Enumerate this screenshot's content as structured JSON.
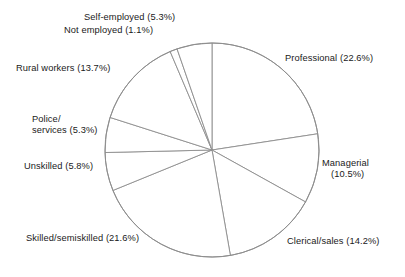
{
  "chart_data": {
    "type": "pie",
    "title": "",
    "subtitle": "",
    "xlabel": "",
    "ylabel": "",
    "legend_position": "none",
    "grid": false,
    "start_angle_deg": 0,
    "direction": "clockwise",
    "units": "percent",
    "total": 100.1,
    "categories": [
      "Professional",
      "Managerial",
      "Clerical/sales",
      "Skilled/semiskilled",
      "Unskilled",
      "Police/services",
      "Rural workers",
      "Not employed",
      "Self-employed"
    ],
    "values": [
      22.6,
      10.5,
      14.2,
      21.6,
      5.8,
      5.3,
      13.7,
      1.1,
      5.3
    ],
    "slices": [
      {
        "name": "Professional",
        "value": 22.6,
        "label": "Professional (22.6%)"
      },
      {
        "name": "Managerial",
        "value": 10.5,
        "label": "Managerial (10.5%)"
      },
      {
        "name": "Clerical/sales",
        "value": 14.2,
        "label": "Clerical/sales (14.2%)"
      },
      {
        "name": "Skilled/semiskilled",
        "value": 21.6,
        "label": "Skilled/semiskilled (21.6%)"
      },
      {
        "name": "Unskilled",
        "value": 5.8,
        "label": "Unskilled (5.8%)"
      },
      {
        "name": "Police/services",
        "value": 5.3,
        "label": "Police/ services (5.3%)"
      },
      {
        "name": "Rural workers",
        "value": 13.7,
        "label": "Rural workers (13.7%)"
      },
      {
        "name": "Not employed",
        "value": 1.1,
        "label": "Not employed (1.1%)"
      },
      {
        "name": "Self-employed",
        "value": 5.3,
        "label": "Self-employed (5.3%)"
      }
    ],
    "colors": {
      "slice_fill": "#ffffff",
      "slice_outline": "#8d8d8d",
      "label_text": "#1a1a1a",
      "background": "#ffffff"
    }
  },
  "labels": {
    "self_employed": "Self-employed (5.3%)",
    "not_employed": "Not employed (1.1%)",
    "rural_workers": "Rural workers (13.7%)",
    "police_line1": "Police/",
    "police_line2": "services (5.3%)",
    "unskilled": "Unskilled (5.8%)",
    "skilled": "Skilled/semiskilled (21.6%)",
    "professional": "Professional (22.6%)",
    "managerial_line1": "Managerial",
    "managerial_line2": "(10.5%)",
    "clerical": "Clerical/sales (14.2%)"
  }
}
